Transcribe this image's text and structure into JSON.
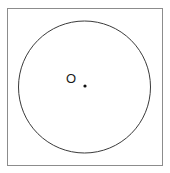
{
  "figure": {
    "background_color": "#ffffff",
    "frame": {
      "name": "outer-square-border",
      "x": 7,
      "y": 8,
      "width": 155,
      "height": 157,
      "stroke_color": "#8c8c8c",
      "stroke_width": 1,
      "fill": "none"
    },
    "circle": {
      "name": "circle-outline",
      "center_x": 84.5,
      "center_y": 87,
      "radius": 66,
      "stroke_color": "#3a3a3a",
      "stroke_width": 1,
      "fill": "none"
    },
    "center_point": {
      "name": "center-dot",
      "x": 85,
      "y": 86,
      "radius": 1.6,
      "color": "#111111"
    },
    "labels": [
      {
        "name": "center-label-o",
        "text": "O",
        "x": 71,
        "y": 83,
        "color": "#1a1a1a",
        "font_size": 13
      }
    ]
  }
}
